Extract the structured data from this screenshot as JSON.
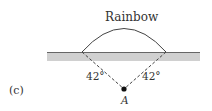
{
  "diagram": {
    "title": "Rainbow",
    "panel_label": "(c)",
    "point_label": "A",
    "angle_left": "42°",
    "angle_right": "42°",
    "colors": {
      "ground": "#d0d0d0",
      "horizon_line": "#666666",
      "arc": "#444444",
      "dashed": "#444444",
      "point": "#111111"
    }
  }
}
